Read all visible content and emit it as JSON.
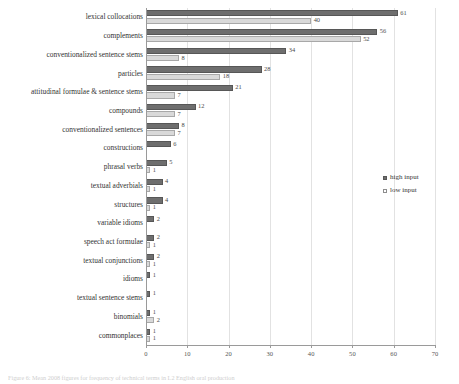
{
  "chart_data": {
    "type": "bar",
    "orientation": "horizontal",
    "title": "",
    "xlabel": "",
    "ylabel": "",
    "xlim": [
      0,
      70
    ],
    "xticks": [
      "0",
      "10",
      "20",
      "30",
      "40",
      "50",
      "60",
      "70"
    ],
    "grid": "vertical",
    "legend_position": "right",
    "categories": [
      "lexical collocations",
      "complements",
      "conventionalized sentence stems",
      "particles",
      "attitudinal formulae & sentence stems",
      "compounds",
      "conventionalized sentences",
      "constructions",
      "phrasal verbs",
      "textual adverbials",
      "structures",
      "variable idioms",
      "speech act formulae",
      "textual conjunctions",
      "idioms",
      "textual sentence stems",
      "binomials",
      "commonplaces"
    ],
    "series": [
      {
        "name": "high input",
        "color": "#6e6e6e",
        "values": [
          61,
          56,
          34,
          28,
          21,
          12,
          8,
          6,
          5,
          4,
          4,
          2,
          2,
          2,
          1,
          1,
          1,
          1
        ]
      },
      {
        "name": "low input",
        "color": "#d9d9d9",
        "values": [
          40,
          52,
          8,
          18,
          7,
          7,
          7,
          null,
          1,
          1,
          1,
          null,
          1,
          1,
          null,
          null,
          2,
          1
        ]
      }
    ]
  },
  "legend": {
    "items": [
      {
        "label": "high input",
        "swatch": "filled-dark-square-icon"
      },
      {
        "label": "low input",
        "swatch": "outlined-light-square-icon"
      }
    ]
  },
  "caption": {
    "text": "Figure 6: Mean 2008 figures for frequency of technical terms in L2 English oral production"
  }
}
